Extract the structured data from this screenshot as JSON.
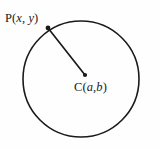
{
  "figure": {
    "type": "geometry-diagram",
    "background_color": "#fefefe",
    "stroke_color": "#1a1a1a",
    "width": 159,
    "height": 150,
    "circle": {
      "name": "circle",
      "center_x": 81,
      "center_y": 79,
      "radius": 58,
      "stroke_width": 1.6,
      "fill": "none"
    },
    "center_point": {
      "name": "center-point",
      "x": 85,
      "y": 75,
      "dot_radius": 2.1,
      "label_roman": "C",
      "label_open_paren": "(",
      "label_var_a": "a",
      "label_comma": ",",
      "label_var_b": "b",
      "label_close_paren": ")",
      "label_full": "C(a,b)"
    },
    "circumference_point": {
      "name": "point-p",
      "x": 48,
      "y": 28,
      "dot_radius": 2.4,
      "label_roman": "P",
      "label_open_paren": "(",
      "label_var_x": "x",
      "label_comma": ", ",
      "label_var_y": "y",
      "label_close_paren": ")",
      "label_full": "P(x, y)"
    },
    "radius_segment": {
      "name": "radius-segment",
      "x1": 48,
      "y1": 28,
      "x2": 85,
      "y2": 75,
      "stroke_width": 1.7
    }
  }
}
